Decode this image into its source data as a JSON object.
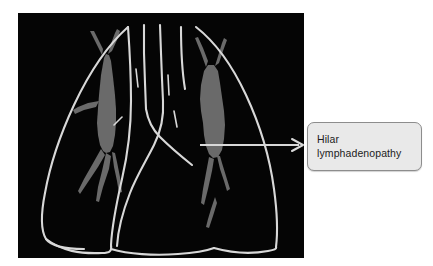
{
  "figure": {
    "type": "annotated-chest-radiograph-illustration",
    "background_color": "#ffffff"
  },
  "xray": {
    "name": "chest-xray-line-illustration",
    "background_color": "#050505",
    "outline_color": "#d8d8d8",
    "structure_color": "#6a6a6a",
    "description_parts": [
      "right-lung-outline",
      "left-lung-outline",
      "trachea",
      "right-hilar-mass",
      "left-hilar-mass",
      "pulmonary-vessels",
      "diaphragm"
    ]
  },
  "annotation": {
    "arrow": {
      "name": "hilar-lymphadenopathy-arrow",
      "color": "#d8d8d8",
      "start_x": 200,
      "start_y": 145,
      "end_x": 303,
      "end_y": 145
    },
    "label": {
      "name": "hilar-lymphadenopathy-label",
      "line1": "Hilar",
      "line2": "lymphadenopathy",
      "text_color": "#1c1c1c",
      "box_fill": "#e9e9e9",
      "box_border": "#8d8d8d"
    }
  }
}
